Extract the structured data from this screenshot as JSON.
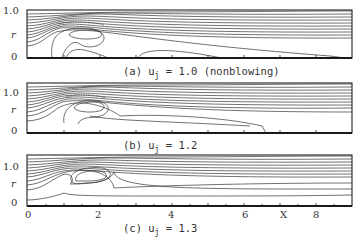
{
  "figure": {
    "panels": [
      {
        "id": "a",
        "caption": "(a) u",
        "sub": "j",
        "caption_rest": " = 1.0 (nonblowing)",
        "u_j": 1.0,
        "note": "nonblowing"
      },
      {
        "id": "b",
        "caption": "(b) u",
        "sub": "j",
        "caption_rest": " = 1.2",
        "u_j": 1.2
      },
      {
        "id": "c",
        "caption": "(c) u",
        "sub": "j",
        "caption_rest": " = 1.3",
        "u_j": 1.3
      }
    ],
    "y_axis": {
      "label": "r",
      "ticks": [
        "0",
        "1.0"
      ]
    },
    "x_axis": {
      "label": "X",
      "ticks": [
        "0",
        "2",
        "4",
        "6",
        "8"
      ]
    }
  }
}
